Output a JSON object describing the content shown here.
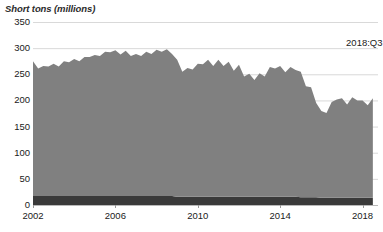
{
  "chart_data": {
    "type": "area",
    "title": "",
    "xlabel": "",
    "ylabel": "Short tons (millions)",
    "ylim": [
      0,
      350
    ],
    "xlim": [
      2002,
      2018.75
    ],
    "grid": true,
    "legend_position": "none",
    "stacked": true,
    "annotations": [
      {
        "text": "2018:Q3",
        "x": 2017.2,
        "y": 322
      }
    ],
    "ytick_labels": [
      "0",
      "50",
      "100",
      "150",
      "200",
      "250",
      "300",
      "350"
    ],
    "ytick_values": [
      0,
      50,
      100,
      150,
      200,
      250,
      300,
      350
    ],
    "xtick_labels": [
      "2002",
      "2006",
      "2010",
      "2014",
      "2018"
    ],
    "xtick_values": [
      2002,
      2006,
      2010,
      2014,
      2018
    ],
    "x": [
      2002.0,
      2002.25,
      2002.5,
      2002.75,
      2003.0,
      2003.25,
      2003.5,
      2003.75,
      2004.0,
      2004.25,
      2004.5,
      2004.75,
      2005.0,
      2005.25,
      2005.5,
      2005.75,
      2006.0,
      2006.25,
      2006.5,
      2006.75,
      2007.0,
      2007.25,
      2007.5,
      2007.75,
      2008.0,
      2008.25,
      2008.5,
      2008.75,
      2009.0,
      2009.25,
      2009.5,
      2009.75,
      2010.0,
      2010.25,
      2010.5,
      2010.75,
      2011.0,
      2011.25,
      2011.5,
      2011.75,
      2012.0,
      2012.25,
      2012.5,
      2012.75,
      2013.0,
      2013.25,
      2013.5,
      2013.75,
      2014.0,
      2014.25,
      2014.5,
      2014.75,
      2015.0,
      2015.25,
      2015.5,
      2015.75,
      2016.0,
      2016.25,
      2016.5,
      2016.75,
      2017.0,
      2017.25,
      2017.5,
      2017.75,
      2018.0,
      2018.25,
      2018.5
    ],
    "series": [
      {
        "name": "Series 1 (upper area)",
        "color": "#808080",
        "values": [
          258,
          244,
          249,
          248,
          253,
          248,
          258,
          256,
          262,
          258,
          266,
          266,
          270,
          268,
          276,
          275,
          279,
          271,
          278,
          268,
          272,
          268,
          276,
          272,
          280,
          276,
          281,
          272,
          262,
          239,
          246,
          243,
          254,
          253,
          262,
          250,
          262,
          250,
          258,
          241,
          252,
          230,
          235,
          223,
          236,
          230,
          248,
          245,
          250,
          238,
          248,
          242,
          240,
          212,
          210,
          180,
          166,
          162,
          183,
          188,
          190,
          178,
          192,
          186,
          186,
          177,
          190
        ]
      },
      {
        "name": "Series 2 (base band)",
        "color": "#3a3a3a",
        "values": [
          17,
          17,
          17,
          17,
          17,
          17,
          17,
          17,
          17,
          17,
          17,
          17,
          17,
          17,
          17,
          17,
          17,
          17,
          17,
          17,
          17,
          17,
          17,
          17,
          17,
          17,
          17,
          17,
          16,
          16,
          16,
          16,
          16,
          16,
          16,
          16,
          16,
          16,
          16,
          16,
          16,
          16,
          16,
          16,
          16,
          16,
          16,
          16,
          16,
          16,
          16,
          16,
          15,
          15,
          15,
          15,
          14,
          14,
          14,
          14,
          14,
          14,
          14,
          14,
          14,
          14,
          14
        ]
      }
    ]
  },
  "axis": {
    "unit_label": "Short tons (millions)"
  },
  "colors": {
    "area_upper": "#808080",
    "area_base": "#3a3a3a",
    "gridline": "#d9d9d9",
    "axis_line": "#b9b9b9",
    "text": "#1a1a1a"
  }
}
